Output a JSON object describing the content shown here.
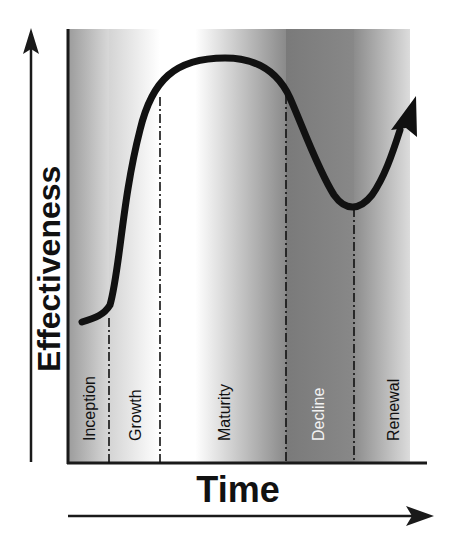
{
  "diagram": {
    "y_axis_label": "Effectiveness",
    "x_axis_label": "Time",
    "phases": [
      {
        "label": "Inception",
        "x_start": 67,
        "x_end": 109,
        "text_color": "#111111"
      },
      {
        "label": "Growth",
        "x_start": 109,
        "x_end": 160,
        "text_color": "#111111"
      },
      {
        "label": "Maturity",
        "x_start": 160,
        "x_end": 286,
        "text_color": "#111111"
      },
      {
        "label": "Decline",
        "x_start": 286,
        "x_end": 354,
        "text_color": "#f2f2f2"
      },
      {
        "label": "Renewal",
        "x_start": 354,
        "x_end": 410,
        "text_color": "#111111"
      }
    ],
    "colors": {
      "curve": "#111111",
      "axis": "#1a1a1a",
      "dark_band": "#7a7a7a",
      "light": "#ffffff"
    }
  }
}
